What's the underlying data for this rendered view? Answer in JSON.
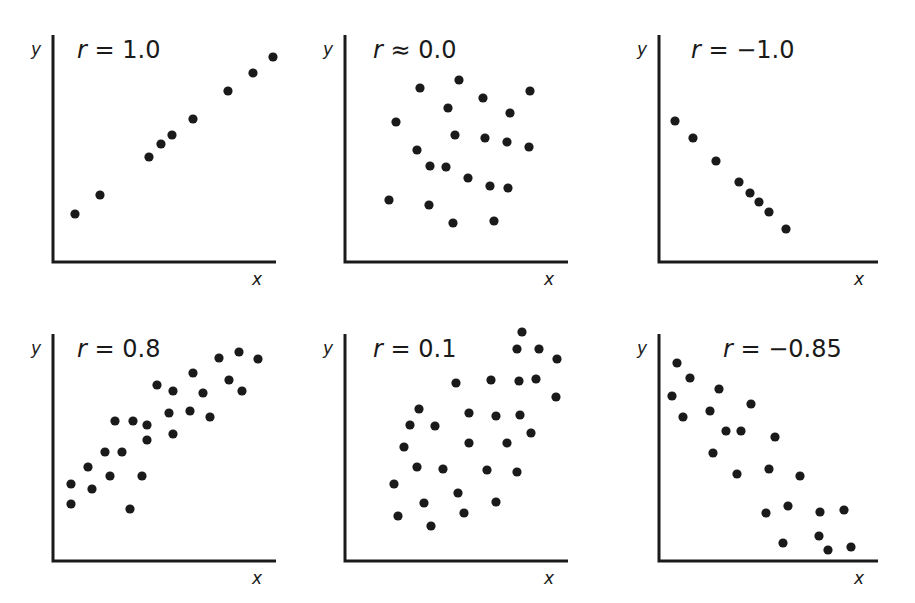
{
  "chart_data": [
    {
      "type": "scatter",
      "title": "r = 1.0",
      "r_symbol": "r",
      "relation": "=",
      "r_value": "1.0",
      "xlabel": "x",
      "ylabel": "y",
      "grid": false,
      "axis": {
        "x0": 53,
        "y0": 262,
        "x1": 276,
        "ytop": 35
      },
      "points": [
        [
          75,
          214
        ],
        [
          100,
          195
        ],
        [
          149,
          157
        ],
        [
          161,
          144
        ],
        [
          172,
          135
        ],
        [
          193,
          119
        ],
        [
          228,
          91
        ],
        [
          253,
          73
        ],
        [
          273,
          57
        ]
      ]
    },
    {
      "type": "scatter",
      "title": "r ≈ 0.0",
      "r_symbol": "r",
      "relation": "≈",
      "r_value": "0.0",
      "xlabel": "x",
      "ylabel": "y",
      "grid": false,
      "axis": {
        "x0": 345,
        "y0": 262,
        "x1": 568,
        "ytop": 35
      },
      "points": [
        [
          420,
          88
        ],
        [
          459,
          80
        ],
        [
          483,
          98
        ],
        [
          530,
          91
        ],
        [
          448,
          108
        ],
        [
          510,
          113
        ],
        [
          396,
          122
        ],
        [
          455,
          135
        ],
        [
          485,
          138
        ],
        [
          507,
          142
        ],
        [
          529,
          147
        ],
        [
          417,
          150
        ],
        [
          430,
          166
        ],
        [
          446,
          167
        ],
        [
          468,
          178
        ],
        [
          490,
          186
        ],
        [
          508,
          188
        ],
        [
          389,
          200
        ],
        [
          429,
          205
        ],
        [
          453,
          223
        ],
        [
          494,
          221
        ]
      ]
    },
    {
      "type": "scatter",
      "title": "r = −1.0",
      "r_symbol": "r",
      "relation": "=",
      "r_value": "−1.0",
      "xlabel": "x",
      "ylabel": "y",
      "grid": false,
      "axis": {
        "x0": 659,
        "y0": 262,
        "x1": 878,
        "ytop": 35
      },
      "points": [
        [
          675,
          121
        ],
        [
          693,
          138
        ],
        [
          716,
          161
        ],
        [
          739,
          182
        ],
        [
          750,
          193
        ],
        [
          759,
          202
        ],
        [
          769,
          212
        ],
        [
          786,
          229
        ]
      ]
    },
    {
      "type": "scatter",
      "title": "r = 0.8",
      "r_symbol": "r",
      "relation": "=",
      "r_value": "0.8",
      "xlabel": "x",
      "ylabel": "y",
      "grid": false,
      "axis": {
        "x0": 53,
        "y0": 561,
        "x1": 276,
        "ytop": 334
      },
      "points": [
        [
          71,
          484
        ],
        [
          71,
          504
        ],
        [
          88,
          467
        ],
        [
          92,
          489
        ],
        [
          105,
          452
        ],
        [
          110,
          476
        ],
        [
          115,
          421
        ],
        [
          122,
          452
        ],
        [
          133,
          421
        ],
        [
          130,
          509
        ],
        [
          142,
          476
        ],
        [
          147,
          440
        ],
        [
          147,
          425
        ],
        [
          157,
          385
        ],
        [
          169,
          413
        ],
        [
          173,
          391
        ],
        [
          173,
          434
        ],
        [
          190,
          411
        ],
        [
          193,
          373
        ],
        [
          203,
          393
        ],
        [
          210,
          417
        ],
        [
          219,
          358
        ],
        [
          229,
          380
        ],
        [
          239,
          352
        ],
        [
          242,
          391
        ],
        [
          258,
          359
        ]
      ]
    },
    {
      "type": "scatter",
      "title": "r = 0.1",
      "r_symbol": "r",
      "relation": "=",
      "r_value": "0.1",
      "xlabel": "x",
      "ylabel": "y",
      "grid": false,
      "axis": {
        "x0": 345,
        "y0": 561,
        "x1": 568,
        "ytop": 334
      },
      "points": [
        [
          522,
          332
        ],
        [
          517,
          349
        ],
        [
          539,
          349
        ],
        [
          557,
          359
        ],
        [
          456,
          383
        ],
        [
          491,
          380
        ],
        [
          519,
          381
        ],
        [
          536,
          379
        ],
        [
          556,
          397
        ],
        [
          419,
          409
        ],
        [
          469,
          413
        ],
        [
          496,
          416
        ],
        [
          520,
          415
        ],
        [
          410,
          425
        ],
        [
          435,
          426
        ],
        [
          469,
          443
        ],
        [
          507,
          443
        ],
        [
          531,
          433
        ],
        [
          404,
          447
        ],
        [
          417,
          467
        ],
        [
          443,
          469
        ],
        [
          487,
          470
        ],
        [
          517,
          472
        ],
        [
          394,
          484
        ],
        [
          424,
          503
        ],
        [
          458,
          493
        ],
        [
          496,
          502
        ],
        [
          398,
          516
        ],
        [
          464,
          513
        ],
        [
          431,
          526
        ]
      ]
    },
    {
      "type": "scatter",
      "title": "r = −0.85",
      "r_symbol": "r",
      "relation": "=",
      "r_value": "−0.85",
      "xlabel": "x",
      "ylabel": "y",
      "grid": false,
      "axis": {
        "x0": 659,
        "y0": 561,
        "x1": 878,
        "ytop": 334
      },
      "points": [
        [
          677,
          363
        ],
        [
          690,
          378
        ],
        [
          672,
          396
        ],
        [
          683,
          417
        ],
        [
          719,
          389
        ],
        [
          710,
          411
        ],
        [
          751,
          404
        ],
        [
          726,
          431
        ],
        [
          741,
          431
        ],
        [
          775,
          437
        ],
        [
          713,
          453
        ],
        [
          737,
          474
        ],
        [
          769,
          469
        ],
        [
          800,
          476
        ],
        [
          766,
          513
        ],
        [
          788,
          506
        ],
        [
          820,
          512
        ],
        [
          844,
          510
        ],
        [
          783,
          543
        ],
        [
          819,
          536
        ],
        [
          828,
          550
        ],
        [
          851,
          547
        ]
      ]
    }
  ],
  "colors": {
    "ink": "#1a1a1a",
    "background": "#ffffff"
  }
}
